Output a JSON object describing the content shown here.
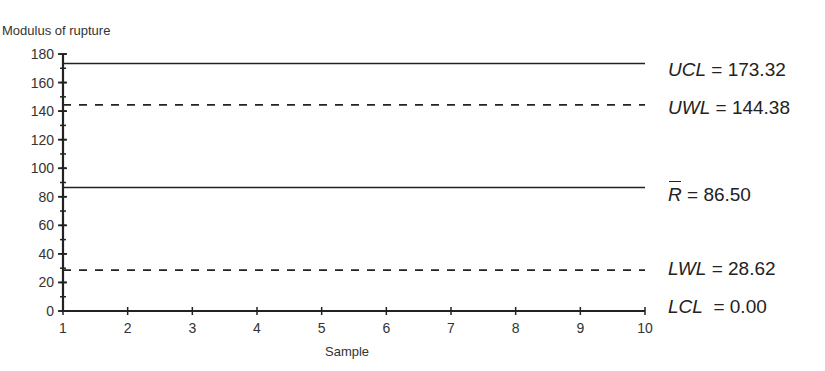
{
  "chart_data": {
    "type": "line",
    "title": "",
    "ylabel": "Modulus of rupture",
    "xlabel": "Sample",
    "xlim": [
      1,
      10
    ],
    "ylim": [
      0,
      180
    ],
    "x_ticks": [
      1,
      2,
      3,
      4,
      5,
      6,
      7,
      8,
      9,
      10
    ],
    "y_ticks": [
      0,
      20,
      40,
      60,
      80,
      100,
      120,
      140,
      160,
      180
    ],
    "y_minor_tick_step": 10,
    "grid": false,
    "series": [
      {
        "name": "UCL",
        "value": 173.32,
        "style": "solid",
        "label": "UCL = 173.32"
      },
      {
        "name": "UWL",
        "value": 144.38,
        "style": "dashed",
        "label": "UWL = 144.38"
      },
      {
        "name": "R-bar",
        "value": 86.5,
        "style": "solid",
        "label": "R̄ = 86.50"
      },
      {
        "name": "LWL",
        "value": 28.62,
        "style": "dashed",
        "label": "LWL = 28.62"
      },
      {
        "name": "LCL",
        "value": 0.0,
        "style": "solid",
        "label": "LCL = 0.00"
      }
    ],
    "legend_position": "right-inline"
  },
  "labels": {
    "ucl": {
      "sym": "UCL",
      "eq": " = 173.32"
    },
    "uwl": {
      "sym": "UWL",
      "eq": " = 144.38"
    },
    "rbar": {
      "sym": "R",
      "eq": " = 86.50"
    },
    "lwl": {
      "sym": "LWL",
      "eq": " = 28.62"
    },
    "lcl": {
      "sym": "LCL",
      "eq": "  = 0.00"
    }
  }
}
